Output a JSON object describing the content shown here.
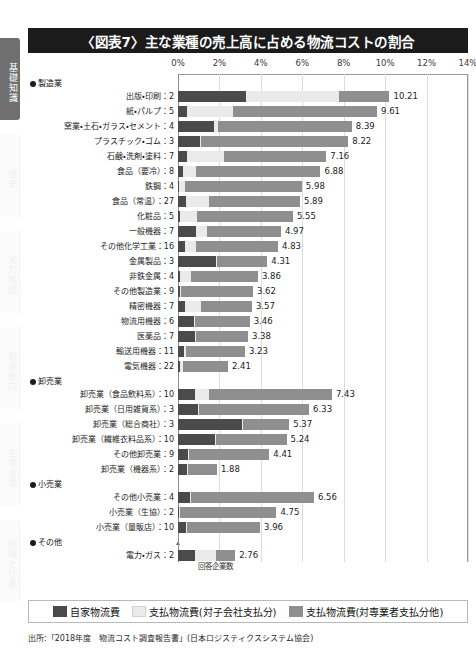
{
  "sidebar": {
    "tabs": [
      {
        "label": "基礎知識",
        "active": true
      },
      {
        "label": "歴史",
        "active": false
      },
      {
        "label": "実力地図",
        "active": false
      },
      {
        "label": "最新動向",
        "active": false
      },
      {
        "label": "主要企業",
        "active": false
      },
      {
        "label": "組織と仕事",
        "active": false
      }
    ]
  },
  "header": {
    "title": "〈図表7〉主な業種の売上高に占める物流コストの割合"
  },
  "annotations": {
    "count_note": "回答企業数"
  },
  "legend": {
    "position": "bottom",
    "items": [
      {
        "label": "自家物流費",
        "color": "#4b4b4b"
      },
      {
        "label": "支払物流費(対子会社支払分)",
        "color": "#eaeaea"
      },
      {
        "label": "支払物流費(対専業者支払分他)",
        "color": "#8f8f8f"
      }
    ]
  },
  "source": {
    "text": "出所:「2018年度　物流コスト調査報告書」(日本ロジスティクスシステム協会)"
  },
  "chart_data": {
    "type": "bar",
    "orientation": "horizontal",
    "stacked": true,
    "title": "〈図表7〉主な業種の売上高に占める物流コストの割合",
    "xlabel": "",
    "ylabel": "",
    "xlim": [
      0,
      14
    ],
    "xticks": [
      0,
      2,
      4,
      6,
      8,
      10,
      12,
      14
    ],
    "xtick_labels": [
      "0%",
      "2%",
      "4%",
      "6%",
      "8%",
      "10%",
      "12%",
      "14%"
    ],
    "grid": true,
    "series": [
      {
        "name": "自家物流費",
        "color": "#4b4b4b"
      },
      {
        "name": "支払物流費(対子会社支払分)",
        "color": "#eaeaea"
      },
      {
        "name": "支払物流費(対専業者支払分他)",
        "color": "#8f8f8f"
      }
    ],
    "groups": [
      {
        "group": "製造業",
        "rows": [
          {
            "category": "出版・印刷",
            "count": 2,
            "total": 10.21,
            "values": [
              3.3,
              4.45,
              2.46
            ]
          },
          {
            "category": "紙・パルプ",
            "count": 5,
            "total": 9.61,
            "values": [
              0.45,
              2.2,
              6.96
            ]
          },
          {
            "category": "窯業・土石・ガラス・セメント",
            "count": 4,
            "total": 8.39,
            "values": [
              1.75,
              0.18,
              6.46
            ]
          },
          {
            "category": "プラスチック・ゴム",
            "count": 3,
            "total": 8.22,
            "values": [
              1.05,
              0.05,
              7.12
            ]
          },
          {
            "category": "石鹸・洗剤・塗料",
            "count": 7,
            "total": 7.16,
            "values": [
              0.45,
              1.75,
              4.96
            ]
          },
          {
            "category": "食品（要冷）",
            "count": 8,
            "total": 6.88,
            "values": [
              0.25,
              0.62,
              6.01
            ]
          },
          {
            "category": "鉄鋼",
            "count": 4,
            "total": 5.98,
            "values": [
              0.05,
              0.3,
              5.63
            ]
          },
          {
            "category": "食品（常温）",
            "count": 27,
            "total": 5.89,
            "values": [
              0.4,
              1.1,
              4.39
            ]
          },
          {
            "category": "化粧品",
            "count": 5,
            "total": 5.55,
            "values": [
              0.1,
              0.8,
              4.65
            ]
          },
          {
            "category": "一般機器",
            "count": 7,
            "total": 4.97,
            "values": [
              0.85,
              0.55,
              3.57
            ]
          },
          {
            "category": "その他化学工業",
            "count": 16,
            "total": 4.83,
            "values": [
              0.35,
              0.5,
              3.98
            ]
          },
          {
            "category": "金属製品",
            "count": 3,
            "total": 4.31,
            "values": [
              1.85,
              0.05,
              2.41
            ]
          },
          {
            "category": "非鉄金属",
            "count": 4,
            "total": 3.86,
            "values": [
              0.1,
              0.55,
              3.21
            ]
          },
          {
            "category": "その他製造業",
            "count": 9,
            "total": 3.62,
            "values": [
              0.1,
              0.05,
              3.47
            ]
          },
          {
            "category": "精密機器",
            "count": 7,
            "total": 3.57,
            "values": [
              0.35,
              0.75,
              2.47
            ]
          },
          {
            "category": "物流用機器",
            "count": 6,
            "total": 3.46,
            "values": [
              0.75,
              0.05,
              2.66
            ]
          },
          {
            "category": "医薬品",
            "count": 7,
            "total": 3.38,
            "values": [
              0.8,
              0.05,
              2.53
            ]
          },
          {
            "category": "輸送用機器",
            "count": 11,
            "total": 3.23,
            "values": [
              0.3,
              0.1,
              2.83
            ]
          },
          {
            "category": "電気機器",
            "count": 22,
            "total": 2.41,
            "values": [
              0.1,
              0.12,
              2.19
            ]
          }
        ]
      },
      {
        "group": "卸売業",
        "rows": [
          {
            "category": "卸売業（食品飲料系）",
            "count": 10,
            "total": 7.43,
            "values": [
              0.8,
              0.72,
              5.91
            ]
          },
          {
            "category": "卸売業（日用雑貨系）",
            "count": 3,
            "total": 6.33,
            "values": [
              0.95,
              0.05,
              5.33
            ]
          },
          {
            "category": "卸売業（総合商社）",
            "count": 3,
            "total": 5.37,
            "values": [
              3.1,
              0.05,
              2.22
            ]
          },
          {
            "category": "卸売業（繊維衣料品系）",
            "count": 10,
            "total": 5.24,
            "values": [
              1.8,
              0.05,
              3.39
            ]
          },
          {
            "category": "その他卸売業",
            "count": 9,
            "total": 4.41,
            "values": [
              0.5,
              0.05,
              3.86
            ]
          },
          {
            "category": "卸売業（機器系）",
            "count": 2,
            "total": 1.88,
            "values": [
              0.45,
              0.05,
              1.38
            ]
          }
        ]
      },
      {
        "group": "小売業",
        "rows": [
          {
            "category": "その他小売業",
            "count": 4,
            "total": 6.56,
            "values": [
              0.6,
              0.05,
              5.91
            ]
          },
          {
            "category": "小売業（生協）",
            "count": 2,
            "total": 4.75,
            "values": [
              0.05,
              0.05,
              4.65
            ]
          },
          {
            "category": "小売業（量販店）",
            "count": 10,
            "total": 3.96,
            "values": [
              0.4,
              0.05,
              3.51
            ]
          }
        ]
      },
      {
        "group": "その他",
        "rows": [
          {
            "category": "電力・ガス",
            "count": 2,
            "total": 2.76,
            "values": [
              0.8,
              1.05,
              0.91
            ]
          }
        ]
      }
    ]
  }
}
